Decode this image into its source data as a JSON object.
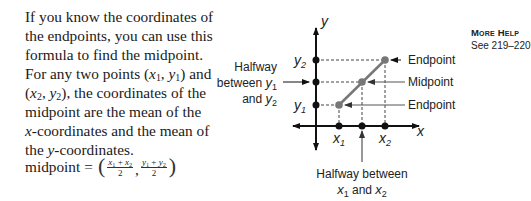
{
  "body_text": {
    "lines": [
      "If you know the coordinates of",
      "the endpoints, you can use this",
      "formula to find the midpoint.",
      "For any two points ",
      ", the coordinates of the",
      "midpoint are the mean of the",
      "-coordinates and the mean of",
      "-coordinates."
    ],
    "pt1": {
      "x": "x",
      "xs": "1",
      "y": "y",
      "ys": "1"
    },
    "and": " and",
    "pt2": {
      "x": "x",
      "xs": "2",
      "y": "y",
      "ys": "2"
    },
    "x_var": "x",
    "the": "the ",
    "y_var": "y"
  },
  "formula": {
    "lhs": "midpoint",
    "eq": "=",
    "open": "(",
    "close": ")",
    "comma": ",",
    "frac1": {
      "a": "x",
      "as": "1",
      "plus": " + ",
      "b": "x",
      "bs": "2",
      "den": "2"
    },
    "frac2": {
      "a": "y",
      "as": "1",
      "plus": " + ",
      "b": "y",
      "bs": "2",
      "den": "2"
    }
  },
  "diagram": {
    "axis_x": "x",
    "axis_y": "y",
    "y2_label": "y",
    "y2_sub": "2",
    "y1_label": "y",
    "y1_sub": "1",
    "x1_label": "x",
    "x1_sub": "1",
    "x2_label": "x",
    "x2_sub": "2",
    "halfway_y": {
      "line1": "Halfway",
      "line2a": "between ",
      "line2v": "y",
      "line2s": "1",
      "line3a": "and ",
      "line3v": "y",
      "line3s": "2"
    },
    "halfway_x": {
      "line1": "Halfway between",
      "line2v1": "x",
      "line2s1": "1",
      "line2mid": " and ",
      "line2v2": "x",
      "line2s2": "2"
    },
    "endpoint_upper": "Endpoint",
    "midpoint": "Midpoint",
    "endpoint_lower": "Endpoint"
  },
  "more_help": {
    "title": "More Help",
    "ref": "See 219–220"
  }
}
